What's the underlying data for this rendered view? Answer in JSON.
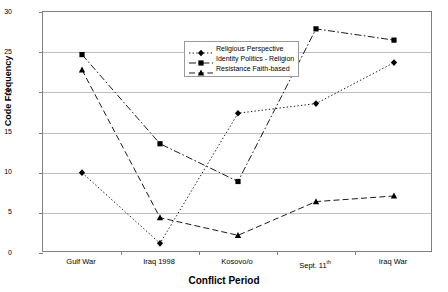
{
  "chart_data": {
    "type": "line",
    "title": "",
    "xlabel": "Conflict Period",
    "ylabel": "Code Frequency",
    "categories": [
      "Gulf War",
      "Iraq 1998",
      "Kosovo/o",
      "Sept. 11th",
      "Iraq War"
    ],
    "category_labels_html": [
      "Gulf War",
      "Iraq 1998",
      "Kosovo/o",
      "Sept. 11<sup>th</sup>",
      "Iraq War"
    ],
    "ylim": [
      0,
      30
    ],
    "yticks": [
      0,
      5,
      10,
      15,
      20,
      25,
      30
    ],
    "ytick_labels": [
      "0",
      "5",
      "10",
      "15",
      "20",
      "25",
      "30"
    ],
    "grid": "horizontal",
    "legend_position": "top-right-inside",
    "series": [
      {
        "name": "Religious Perspective",
        "marker": "diamond",
        "dash": "dotted",
        "color": "#000000",
        "values": [
          10.0,
          1.2,
          17.4,
          18.6,
          23.7
        ]
      },
      {
        "name": "Identity Politics - Religion",
        "marker": "square",
        "dash": "dashdot",
        "color": "#000000",
        "values": [
          24.7,
          13.6,
          8.9,
          27.9,
          26.5
        ]
      },
      {
        "name": "Resistance  Faith-based",
        "marker": "triangle",
        "dash": "dashed",
        "color": "#000000",
        "values": [
          22.8,
          4.4,
          2.2,
          6.4,
          7.1
        ]
      }
    ]
  },
  "axes": {
    "y_title": "Code Frequency",
    "x_title": "Conflict Period"
  }
}
